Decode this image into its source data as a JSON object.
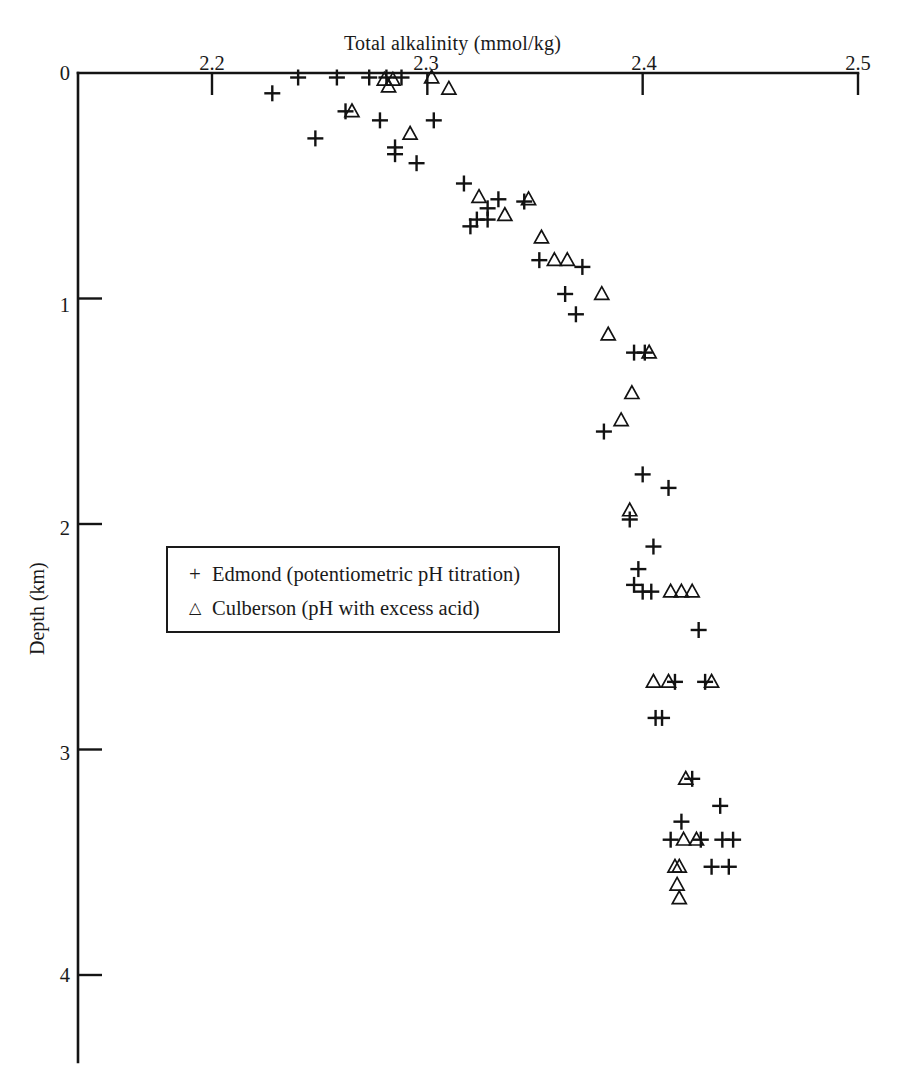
{
  "chart_data": {
    "type": "scatter",
    "title": "Total alkalinity (mmol/kg)",
    "xlabel": "Total alkalinity (mmol/kg)",
    "ylabel": "Depth (km)",
    "xlim": [
      2.15,
      2.5
    ],
    "ylim": [
      0,
      4.37
    ],
    "y_inverted": true,
    "grid": false,
    "x_axis_position": "top",
    "xticks": [
      2.2,
      2.3,
      2.4,
      2.5
    ],
    "xticklabels": [
      "2.2",
      "2.3",
      "2.4",
      "2.5"
    ],
    "yticks": [
      0,
      1,
      2,
      3,
      4
    ],
    "yticklabels": [
      "0",
      "1",
      "2",
      "3",
      "4"
    ],
    "legend_position": "center-left",
    "series": [
      {
        "name": "Edmond  (potentiometric pH titration)",
        "marker": "plus",
        "points": [
          [
            2.24,
            0.02
          ],
          [
            2.258,
            0.02
          ],
          [
            2.273,
            0.02
          ],
          [
            2.281,
            0.02
          ],
          [
            2.288,
            0.02
          ],
          [
            2.228,
            0.09
          ],
          [
            2.262,
            0.17
          ],
          [
            2.278,
            0.21
          ],
          [
            2.303,
            0.21
          ],
          [
            2.248,
            0.29
          ],
          [
            2.285,
            0.33
          ],
          [
            2.285,
            0.36
          ],
          [
            2.295,
            0.4
          ],
          [
            2.317,
            0.49
          ],
          [
            2.333,
            0.56
          ],
          [
            2.345,
            0.57
          ],
          [
            2.328,
            0.6
          ],
          [
            2.323,
            0.65
          ],
          [
            2.328,
            0.65
          ],
          [
            2.32,
            0.68
          ],
          [
            2.352,
            0.83
          ],
          [
            2.372,
            0.86
          ],
          [
            2.364,
            0.98
          ],
          [
            2.369,
            1.07
          ],
          [
            2.396,
            1.24
          ],
          [
            2.401,
            1.24
          ],
          [
            2.382,
            1.59
          ],
          [
            2.4,
            1.78
          ],
          [
            2.412,
            1.84
          ],
          [
            2.394,
            1.98
          ],
          [
            2.405,
            2.1
          ],
          [
            2.398,
            2.2
          ],
          [
            2.396,
            2.27
          ],
          [
            2.4,
            2.3
          ],
          [
            2.404,
            2.3
          ],
          [
            2.426,
            2.47
          ],
          [
            2.415,
            2.7
          ],
          [
            2.429,
            2.7
          ],
          [
            2.406,
            2.86
          ],
          [
            2.409,
            2.86
          ],
          [
            2.423,
            3.13
          ],
          [
            2.436,
            3.25
          ],
          [
            2.418,
            3.32
          ],
          [
            2.413,
            3.4
          ],
          [
            2.427,
            3.4
          ],
          [
            2.437,
            3.4
          ],
          [
            2.442,
            3.4
          ],
          [
            2.432,
            3.52
          ],
          [
            2.44,
            3.52
          ]
        ]
      },
      {
        "name": "Culberson (pH with excess acid)",
        "marker": "triangle",
        "points": [
          [
            2.28,
            0.03
          ],
          [
            2.284,
            0.03
          ],
          [
            2.302,
            0.02
          ],
          [
            2.282,
            0.06
          ],
          [
            2.31,
            0.07
          ],
          [
            2.265,
            0.17
          ],
          [
            2.292,
            0.27
          ],
          [
            2.324,
            0.55
          ],
          [
            2.347,
            0.56
          ],
          [
            2.336,
            0.63
          ],
          [
            2.353,
            0.73
          ],
          [
            2.359,
            0.83
          ],
          [
            2.365,
            0.83
          ],
          [
            2.381,
            0.98
          ],
          [
            2.384,
            1.16
          ],
          [
            2.403,
            1.24
          ],
          [
            2.395,
            1.42
          ],
          [
            2.39,
            1.54
          ],
          [
            2.394,
            1.94
          ],
          [
            2.413,
            2.3
          ],
          [
            2.418,
            2.3
          ],
          [
            2.423,
            2.3
          ],
          [
            2.405,
            2.7
          ],
          [
            2.412,
            2.7
          ],
          [
            2.432,
            2.7
          ],
          [
            2.42,
            3.13
          ],
          [
            2.419,
            3.4
          ],
          [
            2.425,
            3.4
          ],
          [
            2.415,
            3.52
          ],
          [
            2.417,
            3.52
          ],
          [
            2.416,
            3.6
          ],
          [
            2.417,
            3.66
          ]
        ]
      }
    ]
  },
  "axes": {
    "title_top": "Total alkalinity (mmol/kg)",
    "y_title": "Depth (km)",
    "x_tick_labels": [
      "2.2",
      "2.3",
      "2.4",
      "2.5"
    ],
    "y_tick_labels": [
      "0",
      "1",
      "2",
      "3",
      "4"
    ]
  },
  "legend": {
    "entries": [
      {
        "symbol": "+",
        "label": "Edmond  (potentiometric pH titration)"
      },
      {
        "symbol": "△",
        "label": "Culberson (pH with excess acid)"
      }
    ]
  },
  "colors": {
    "ink": "#141414",
    "background": "#ffffff"
  }
}
